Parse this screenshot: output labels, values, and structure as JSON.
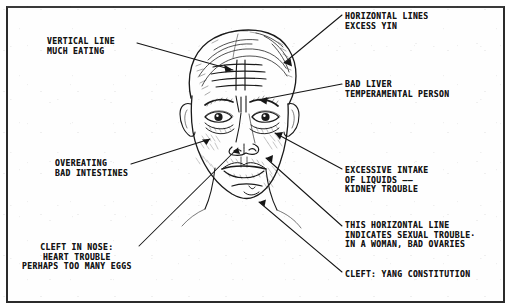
{
  "diagram": {
    "ink_color": "#141414",
    "paper_color": "#fefefe",
    "frame_color": "#2b2b2b",
    "annotations": [
      {
        "id": "vertical-line",
        "lines": [
          "VERTICAL LINE",
          "MUCH EATING"
        ],
        "text": "VERTICAL LINE\nMUCH EATING",
        "side": "left",
        "points_to": "vertical forehead crease between brows"
      },
      {
        "id": "horizontal-lines",
        "lines": [
          "HORIZONTAL LINES",
          "EXCESS YIN"
        ],
        "text": "HORIZONTAL LINES\nEXCESS YIN",
        "side": "right",
        "points_to": "horizontal forehead wrinkles"
      },
      {
        "id": "bad-liver",
        "lines": [
          "BAD LIVER",
          "TEMPERAMENTAL PERSON"
        ],
        "text": "BAD LIVER\nTEMPERAMENTAL PERSON",
        "side": "right",
        "points_to": "glabella between the eyebrows"
      },
      {
        "id": "overeating",
        "lines": [
          "OVEREATING",
          "BAD INTESTINES"
        ],
        "text": "OVEREATING\nBAD INTESTINES",
        "side": "left",
        "points_to": "left cheek beside the nose"
      },
      {
        "id": "excessive-liquids",
        "lines": [
          "EXCESSIVE INTAKE",
          "OF LIQUIDS ——",
          "KIDNEY TROUBLE"
        ],
        "text": "EXCESSIVE INTAKE\nOF LIQUIDS ——\nKIDNEY TROUBLE",
        "side": "right",
        "points_to": "bag under the right eye"
      },
      {
        "id": "sexual-trouble",
        "lines": [
          "THIS HORIZONTAL LINE",
          "INDICATES SEXUAL TROUBLE·",
          "IN A WOMAN, BAD OVARIES"
        ],
        "text": "THIS HORIZONTAL LINE\nINDICATES SEXUAL TROUBLE·\nIN A WOMAN, BAD OVARIES",
        "side": "right",
        "points_to": "horizontal line below the lower lip"
      },
      {
        "id": "cleft-in-nose",
        "lines": [
          "CLEFT IN NOSE:",
          "HEART TROUBLE",
          "PERHAPS TOO MANY EGGS"
        ],
        "text": "CLEFT IN NOSE:\nHEART TROUBLE\nPERHAPS TOO MANY EGGS",
        "side": "left",
        "points_to": "tip of the nose"
      },
      {
        "id": "cleft-yang",
        "lines": [
          "CLEFT: YANG CONSTITUTION"
        ],
        "text": "CLEFT: YANG CONSTITUTION",
        "side": "right",
        "points_to": "cleft of the chin"
      }
    ]
  }
}
